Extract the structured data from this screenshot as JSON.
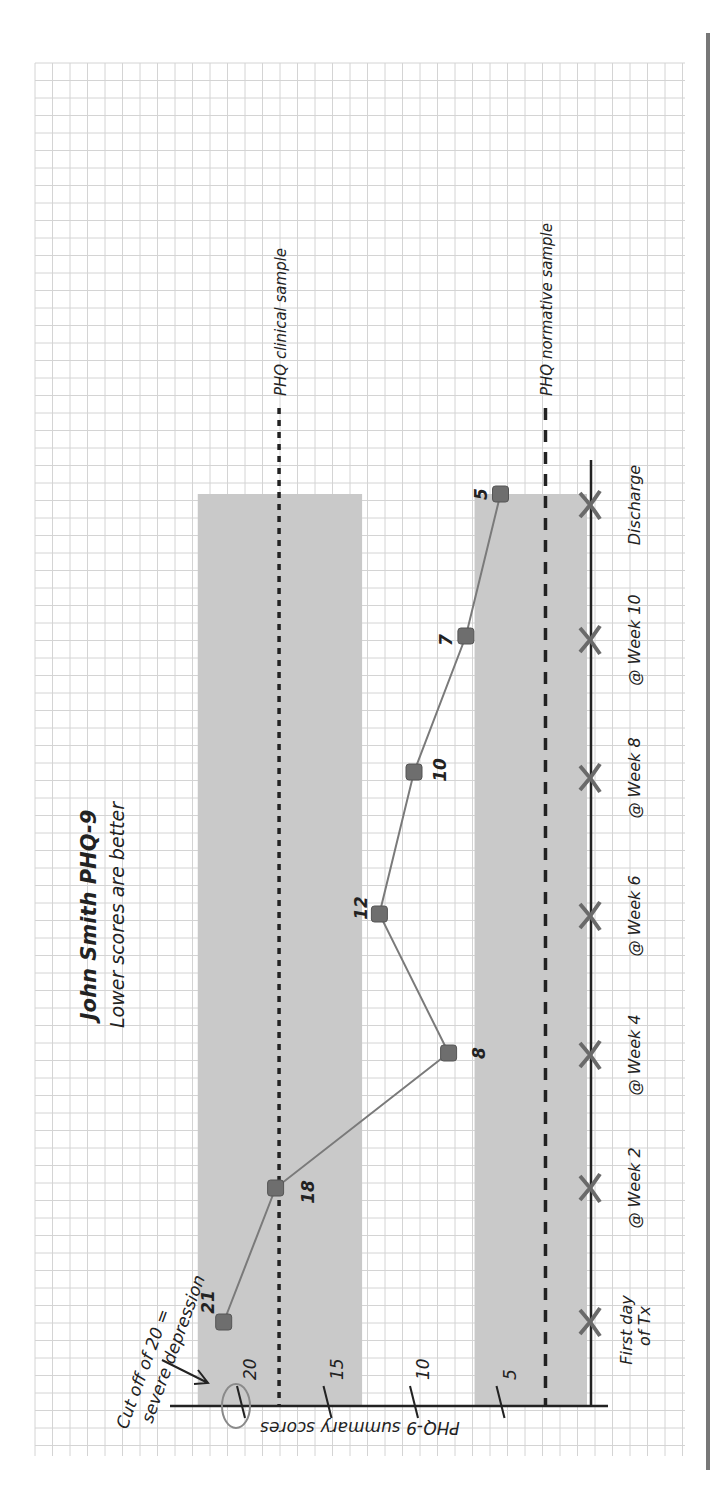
{
  "chart_data": {
    "type": "line",
    "orientation": "rotated-90-clockwise (time axis runs vertically on the right, score axis runs horizontally at the bottom; higher scores to the left)",
    "title": "John Smith PHQ-9",
    "subtitle": "Lower scores are better",
    "xlabel": "",
    "ylabel": "PHQ-9 summary scores",
    "categories": [
      "First day of Tx",
      "@ Week 2",
      "@ Week 4",
      "@ Week 6",
      "@ Week 8",
      "@ Week 10",
      "Discharge"
    ],
    "category_labels": [
      {
        "line1": "First day",
        "line2": "of Tx"
      },
      {
        "line1": "@ Week 2",
        "line2": ""
      },
      {
        "line1": "@ Week 4",
        "line2": ""
      },
      {
        "line1": "@ Week 6",
        "line2": ""
      },
      {
        "line1": "@ Week 8",
        "line2": ""
      },
      {
        "line1": "@ Week 10",
        "line2": ""
      },
      {
        "line1": "Discharge",
        "line2": ""
      }
    ],
    "series": [
      {
        "name": "PHQ-9 score",
        "values": [
          21,
          18,
          8,
          12,
          10,
          7,
          5
        ],
        "color": "#777777"
      }
    ],
    "y_ticks": [
      5,
      10,
      15,
      20
    ],
    "ylim": [
      0,
      24
    ],
    "grid": true,
    "reference_lines": [
      {
        "label": "PHQ clinical sample",
        "value": 17.8,
        "style": "dotted"
      },
      {
        "label": "PHQ normative sample",
        "value": 2.4,
        "style": "dashed"
      }
    ],
    "shaded_bands": [
      {
        "from": 13.0,
        "to": 22.5,
        "color": "#c8c8c8"
      },
      {
        "from": 0,
        "to": 6.5,
        "color": "#c8c8c8"
      }
    ],
    "annotations": [
      {
        "text_line1": "Cut off of 20 =",
        "text_line2": "severe depression",
        "points_to": 20,
        "circled_tick": 20
      }
    ]
  },
  "colors": {
    "grid": "#d4d4d4",
    "band": "#c9c9c9",
    "line": "#7a7a7a",
    "marker": "#6e6e6e",
    "axis": "#222222",
    "x_marker": "#6a6a6a",
    "circle": "#8a8a8a"
  }
}
